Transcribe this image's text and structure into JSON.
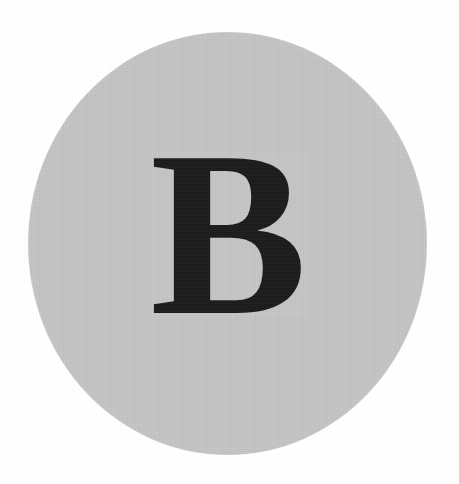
{
  "avatar": {
    "initial": "B",
    "shape": "circle",
    "circle_color": "#c9c9c9",
    "initial_color": "#1a1a1a",
    "background_color": "#ffffff"
  }
}
